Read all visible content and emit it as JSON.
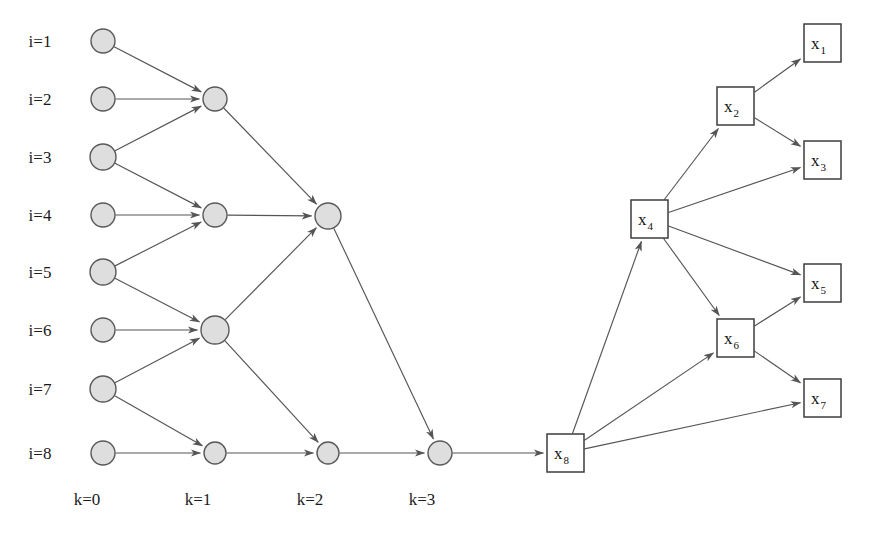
{
  "figure": {
    "background_color": "#ffffff",
    "node_fill": "#dedede",
    "node_stroke": "#595959",
    "box_fill": "#ffffff",
    "box_stroke": "#3d3d3d",
    "edge_color": "#555555"
  },
  "row_labels": [
    {
      "id": "i1",
      "text": "i=1",
      "x": 40,
      "y": 47
    },
    {
      "id": "i2",
      "text": "i=2",
      "x": 40,
      "y": 105
    },
    {
      "id": "i3",
      "text": "i=3",
      "x": 40,
      "y": 163
    },
    {
      "id": "i4",
      "text": "i=4",
      "x": 40,
      "y": 221
    },
    {
      "id": "i5",
      "text": "i=5",
      "x": 40,
      "y": 278
    },
    {
      "id": "i6",
      "text": "i=6",
      "x": 40,
      "y": 336
    },
    {
      "id": "i7",
      "text": "i=7",
      "x": 40,
      "y": 395
    },
    {
      "id": "i8",
      "text": "i=8",
      "x": 40,
      "y": 459
    }
  ],
  "column_labels": [
    {
      "id": "k0",
      "text": "k=0",
      "x": 87,
      "y": 505
    },
    {
      "id": "k1",
      "text": "k=1",
      "x": 198,
      "y": 505
    },
    {
      "id": "k2",
      "text": "k=2",
      "x": 310,
      "y": 505
    },
    {
      "id": "k3",
      "text": "k=3",
      "x": 422,
      "y": 505
    }
  ],
  "circle_nodes": [
    {
      "id": "n-k0-1",
      "level": 0,
      "index": 1,
      "cx": 103,
      "cy": 41,
      "r": 12
    },
    {
      "id": "n-k0-2",
      "level": 0,
      "index": 2,
      "cx": 103,
      "cy": 99,
      "r": 12
    },
    {
      "id": "n-k0-3",
      "level": 0,
      "index": 3,
      "cx": 103,
      "cy": 157,
      "r": 13
    },
    {
      "id": "n-k0-4",
      "level": 0,
      "index": 4,
      "cx": 103,
      "cy": 215,
      "r": 12
    },
    {
      "id": "n-k0-5",
      "level": 0,
      "index": 5,
      "cx": 103,
      "cy": 272,
      "r": 13
    },
    {
      "id": "n-k0-6",
      "level": 0,
      "index": 6,
      "cx": 103,
      "cy": 330,
      "r": 12
    },
    {
      "id": "n-k0-7",
      "level": 0,
      "index": 7,
      "cx": 103,
      "cy": 389,
      "r": 13
    },
    {
      "id": "n-k0-8",
      "level": 0,
      "index": 8,
      "cx": 103,
      "cy": 453,
      "r": 12
    },
    {
      "id": "n-k1-1",
      "level": 1,
      "index": 1,
      "cx": 215,
      "cy": 99,
      "r": 12
    },
    {
      "id": "n-k1-2",
      "level": 1,
      "index": 2,
      "cx": 215,
      "cy": 215,
      "r": 12
    },
    {
      "id": "n-k1-3",
      "level": 1,
      "index": 3,
      "cx": 215,
      "cy": 330,
      "r": 14
    },
    {
      "id": "n-k1-4",
      "level": 1,
      "index": 4,
      "cx": 215,
      "cy": 453,
      "r": 11
    },
    {
      "id": "n-k2-1",
      "level": 2,
      "index": 1,
      "cx": 328,
      "cy": 216,
      "r": 13
    },
    {
      "id": "n-k2-2",
      "level": 2,
      "index": 2,
      "cx": 328,
      "cy": 453,
      "r": 11
    },
    {
      "id": "n-k3-1",
      "level": 3,
      "index": 1,
      "cx": 440,
      "cy": 453,
      "r": 12
    }
  ],
  "box_nodes": [
    {
      "id": "x1",
      "base": "x",
      "sub": "1",
      "x": 804,
      "y": 24,
      "w": 37,
      "h": 38
    },
    {
      "id": "x2",
      "base": "x",
      "sub": "2",
      "x": 717,
      "y": 87,
      "w": 37,
      "h": 38
    },
    {
      "id": "x3",
      "base": "x",
      "sub": "3",
      "x": 804,
      "y": 141,
      "w": 37,
      "h": 38
    },
    {
      "id": "x4",
      "base": "x",
      "sub": "4",
      "x": 631,
      "y": 200,
      "w": 37,
      "h": 38
    },
    {
      "id": "x5",
      "base": "x",
      "sub": "5",
      "x": 804,
      "y": 264,
      "w": 37,
      "h": 38
    },
    {
      "id": "x6",
      "base": "x",
      "sub": "6",
      "x": 717,
      "y": 319,
      "w": 37,
      "h": 38
    },
    {
      "id": "x7",
      "base": "x",
      "sub": "7",
      "x": 804,
      "y": 379,
      "w": 37,
      "h": 38
    },
    {
      "id": "x8",
      "base": "x",
      "sub": "8",
      "x": 547,
      "y": 434,
      "w": 37,
      "h": 38
    }
  ],
  "edges": [
    {
      "id": "e-k0-1-k1-1",
      "from": "n-k0-1",
      "to": "n-k1-1"
    },
    {
      "id": "e-k0-2-k1-1",
      "from": "n-k0-2",
      "to": "n-k1-1"
    },
    {
      "id": "e-k0-3-k1-1",
      "from": "n-k0-3",
      "to": "n-k1-1"
    },
    {
      "id": "e-k0-3-k1-2",
      "from": "n-k0-3",
      "to": "n-k1-2"
    },
    {
      "id": "e-k0-4-k1-2",
      "from": "n-k0-4",
      "to": "n-k1-2"
    },
    {
      "id": "e-k0-5-k1-2",
      "from": "n-k0-5",
      "to": "n-k1-2"
    },
    {
      "id": "e-k0-5-k1-3",
      "from": "n-k0-5",
      "to": "n-k1-3"
    },
    {
      "id": "e-k0-6-k1-3",
      "from": "n-k0-6",
      "to": "n-k1-3"
    },
    {
      "id": "e-k0-7-k1-3",
      "from": "n-k0-7",
      "to": "n-k1-3"
    },
    {
      "id": "e-k0-7-k1-4",
      "from": "n-k0-7",
      "to": "n-k1-4"
    },
    {
      "id": "e-k0-8-k1-4",
      "from": "n-k0-8",
      "to": "n-k1-4"
    },
    {
      "id": "e-k1-1-k2-1",
      "from": "n-k1-1",
      "to": "n-k2-1"
    },
    {
      "id": "e-k1-2-k2-1",
      "from": "n-k1-2",
      "to": "n-k2-1"
    },
    {
      "id": "e-k1-3-k2-1",
      "from": "n-k1-3",
      "to": "n-k2-1"
    },
    {
      "id": "e-k1-3-k2-2",
      "from": "n-k1-3",
      "to": "n-k2-2"
    },
    {
      "id": "e-k1-4-k2-2",
      "from": "n-k1-4",
      "to": "n-k2-2"
    },
    {
      "id": "e-k2-1-k3-1",
      "from": "n-k2-1",
      "to": "n-k3-1"
    },
    {
      "id": "e-k2-2-k3-1",
      "from": "n-k2-2",
      "to": "n-k3-1"
    },
    {
      "id": "e-k3-1-x8",
      "from": "n-k3-1",
      "to": "x8"
    },
    {
      "id": "e-x8-x4",
      "from": "x8",
      "to": "x4"
    },
    {
      "id": "e-x8-x6",
      "from": "x8",
      "to": "x6"
    },
    {
      "id": "e-x8-x7",
      "from": "x8",
      "to": "x7"
    },
    {
      "id": "e-x4-x2",
      "from": "x4",
      "to": "x2"
    },
    {
      "id": "e-x4-x3",
      "from": "x4",
      "to": "x3"
    },
    {
      "id": "e-x4-x5",
      "from": "x4",
      "to": "x5"
    },
    {
      "id": "e-x4-x6",
      "from": "x4",
      "to": "x6"
    },
    {
      "id": "e-x2-x1",
      "from": "x2",
      "to": "x1"
    },
    {
      "id": "e-x2-x3",
      "from": "x2",
      "to": "x3"
    },
    {
      "id": "e-x6-x5",
      "from": "x6",
      "to": "x5"
    },
    {
      "id": "e-x6-x7",
      "from": "x6",
      "to": "x7"
    }
  ]
}
